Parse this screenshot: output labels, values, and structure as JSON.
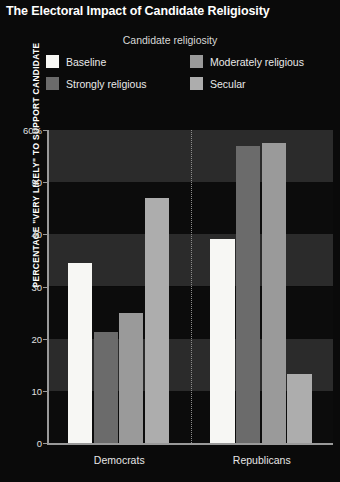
{
  "title": "The Electoral Impact of Candidate Religiosity",
  "legend": {
    "title": "Candidate religiosity",
    "items": [
      {
        "label": "Baseline",
        "color": "#f7f7f4"
      },
      {
        "label": "Moderately religious",
        "color": "#9a9a9a"
      },
      {
        "label": "Strongly religious",
        "color": "#6b6b6b"
      },
      {
        "label": "Secular",
        "color": "#adadad"
      }
    ]
  },
  "axes": {
    "ylabel": "PERCENTAGE \"VERY LIKELY\" TO SUPPORT CANDIDATE",
    "yticks": [
      "60%",
      "50",
      "40",
      "30",
      "20",
      "10",
      "0"
    ],
    "xticks": [
      "Democrats",
      "Republicans"
    ]
  },
  "colors": {
    "background": "#0a0a0a",
    "band_light": "#2b2b2b",
    "band_dark": "#0c0c0c",
    "axis": "#9a9a9a",
    "divider": "#8d8d8d",
    "title_text": "#ffffff"
  },
  "chart_data": {
    "type": "bar",
    "title": "The Electoral Impact of Candidate Religiosity",
    "xlabel": "",
    "ylabel": "PERCENTAGE \"VERY LIKELY\" TO SUPPORT CANDIDATE",
    "ylim": [
      0,
      60
    ],
    "ytick_values": [
      0,
      10,
      20,
      30,
      40,
      50,
      60
    ],
    "grid": "alternating horizontal bands",
    "legend_position": "top-center",
    "legend_title": "Candidate religiosity",
    "categories": [
      "Democrats",
      "Republicans"
    ],
    "series": [
      {
        "name": "Baseline",
        "color": "#f7f7f4",
        "values": [
          34.5,
          39.1
        ]
      },
      {
        "name": "Strongly religious",
        "color": "#6b6b6b",
        "values": [
          21.3,
          57.0
        ]
      },
      {
        "name": "Moderately religious",
        "color": "#9a9a9a",
        "values": [
          25.0,
          57.5
        ]
      },
      {
        "name": "Secular",
        "color": "#adadad",
        "values": [
          47.0,
          13.2
        ]
      }
    ]
  }
}
